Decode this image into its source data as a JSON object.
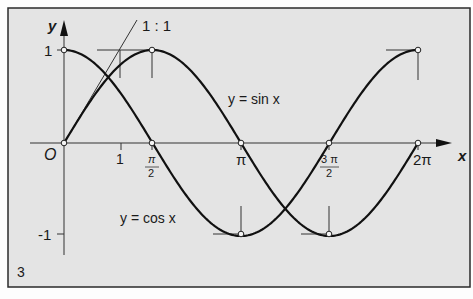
{
  "figure": {
    "number": "3",
    "background": "#e4e4e4",
    "border_color": "#2a2a2a",
    "curve_color": "#111111"
  },
  "axes": {
    "x_label": "x",
    "y_label": "y",
    "origin_label": "O",
    "x_ticks": [
      {
        "value": 1,
        "label": "1"
      },
      {
        "value": 1.5708,
        "label_num": "π",
        "label_den": "2"
      },
      {
        "value": 3.1416,
        "label": "π"
      },
      {
        "value": 4.7124,
        "label_num": "3 π",
        "label_den": "2"
      },
      {
        "value": 6.2832,
        "label": "2π"
      }
    ],
    "y_ticks": [
      {
        "value": 1,
        "label": "1"
      },
      {
        "value": -1,
        "label": "-1"
      }
    ]
  },
  "annotations": {
    "slope_label": "1 : 1",
    "sin_label": "y = sin x",
    "cos_label": "y = cos x"
  },
  "chart_data": {
    "type": "line",
    "title": "",
    "xlabel": "x",
    "ylabel": "y",
    "xlim": [
      0,
      6.2832
    ],
    "ylim": [
      -1,
      1
    ],
    "series": [
      {
        "name": "y = sin x",
        "x": [
          0,
          1.5708,
          3.1416,
          4.7124,
          6.2832
        ],
        "values": [
          0,
          1,
          0,
          -1,
          0
        ]
      },
      {
        "name": "y = cos x",
        "x": [
          0,
          1.5708,
          3.1416,
          4.7124,
          6.2832
        ],
        "values": [
          1,
          0,
          -1,
          0,
          1
        ]
      }
    ],
    "annotations": [
      "1 : 1 tangent slope at origin"
    ]
  }
}
